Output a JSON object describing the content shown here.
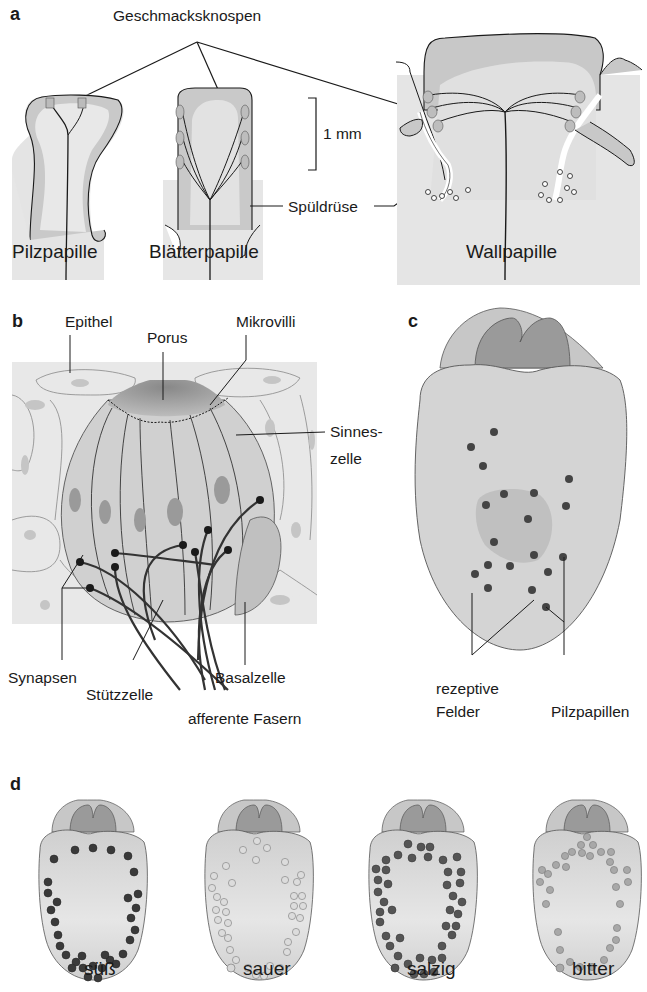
{
  "panels": {
    "a": {
      "letter": "a",
      "labels": {
        "geschmacksknospen": "Geschmacksknospen",
        "scale": "1 mm",
        "spueldruese": "Spüldrüse",
        "pilzpapille": "Pilzpapille",
        "blaetterpapille": "Blätterpapille",
        "wallpapille": "Wallpapille"
      }
    },
    "b": {
      "letter": "b",
      "labels": {
        "epithel": "Epithel",
        "porus": "Porus",
        "mikrovilli": "Mikrovilli",
        "sinnes1": "Sinnes-",
        "sinnes2": "zelle",
        "synapsen": "Synapsen",
        "stuetzzelle": "Stützzelle",
        "basalzelle": "Basalzelle",
        "afferente": "afferente Fasern"
      }
    },
    "c": {
      "letter": "c",
      "labels": {
        "rezeptive1": "rezeptive",
        "rezeptive2": "Felder",
        "pilzpapillen": "Pilzpapillen"
      }
    },
    "d": {
      "letter": "d",
      "legend": [
        {
          "label": "süß",
          "color": "#3a3a3a",
          "stroke": "#2a2a2a"
        },
        {
          "label": "sauer",
          "color": "#d8d8d8",
          "stroke": "#8a8a8a"
        },
        {
          "label": "salzig",
          "color": "#555555",
          "stroke": "#333333"
        },
        {
          "label": "bitter",
          "color": "#a8a8a8",
          "stroke": "#777777"
        }
      ]
    }
  },
  "colors": {
    "tissue_light": "#e6e6e6",
    "tissue_mid": "#c8c8c8",
    "tissue_dark": "#8c8c8c",
    "line": "#1a1a1a"
  }
}
